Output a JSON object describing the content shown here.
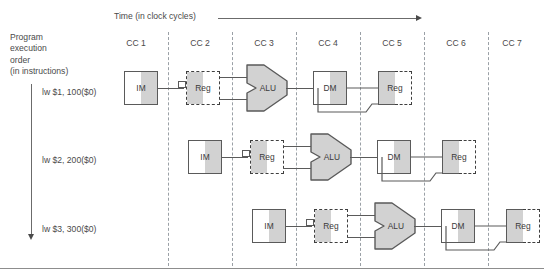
{
  "diagram": {
    "title_time": "Time (in clock cycles)",
    "program_order_label": "Program\nexecution\norder\n(in instructions)",
    "clock_cycles": [
      {
        "label": "CC 1"
      },
      {
        "label": "CC 2"
      },
      {
        "label": "CC 3"
      },
      {
        "label": "CC 4"
      },
      {
        "label": "CC 5"
      },
      {
        "label": "CC 6"
      },
      {
        "label": "CC 7"
      }
    ],
    "instructions": [
      {
        "text": "lw $1, 100($0)",
        "start_cycle": 1
      },
      {
        "text": "lw $2, 200($0)",
        "start_cycle": 2
      },
      {
        "text": "lw $3, 300($0)",
        "start_cycle": 3
      }
    ],
    "stages": [
      {
        "name": "IM",
        "type": "box-solid"
      },
      {
        "name": "Reg",
        "type": "box-dash"
      },
      {
        "name": "ALU",
        "type": "alu"
      },
      {
        "name": "DM",
        "type": "box-solid"
      },
      {
        "name": "Reg",
        "type": "box-wb"
      }
    ],
    "colors": {
      "fill_gray": "#d2d2d2",
      "fill_white": "#ffffff",
      "stroke": "#5a5a5a",
      "divider": "#9aa0a6",
      "text": "#4a4a4a"
    }
  }
}
